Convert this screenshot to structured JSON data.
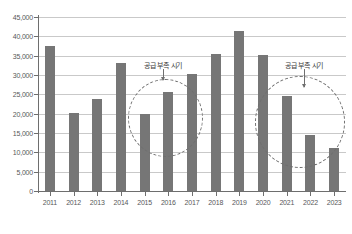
{
  "chart_data": {
    "type": "bar",
    "title": "",
    "subtitle": "",
    "xlabel": "",
    "ylabel": "",
    "categories": [
      "2011",
      "2012",
      "2013",
      "2014",
      "2015",
      "2016",
      "2017",
      "2018",
      "2019",
      "2020",
      "2021",
      "2022",
      "2023"
    ],
    "values": [
      37500,
      20200,
      23800,
      33000,
      20000,
      25500,
      30200,
      35500,
      41500,
      35300,
      24500,
      14500,
      11000
    ],
    "series": [
      {
        "name": "",
        "values": [
          37500,
          20200,
          23800,
          33000,
          20000,
          25500,
          30200,
          35500,
          41500,
          35300,
          24500,
          14500,
          11000
        ]
      }
    ],
    "ylim": [
      0,
      45000
    ],
    "yticks": [
      0,
      5000,
      10000,
      15000,
      20000,
      25000,
      30000,
      35000,
      40000,
      45000
    ],
    "ytick_labels": [
      "0",
      "5,000",
      "10,000",
      "15,000",
      "20,000",
      "25,000",
      "30,000",
      "35,000",
      "40,000",
      "45,000"
    ],
    "grid": true,
    "legend": "none",
    "bar_color": "#767676",
    "grid_color": "#c9c9c9",
    "axis_color": "#6e6e6e",
    "annotations": [
      {
        "text": "공급 부족 시기",
        "shape": "dashed-ellipse",
        "covers": [
          "2015",
          "2016",
          "2017"
        ]
      },
      {
        "text": "공급 부족 시기",
        "shape": "dashed-ellipse",
        "covers": [
          "2021",
          "2022",
          "2023"
        ]
      }
    ]
  }
}
